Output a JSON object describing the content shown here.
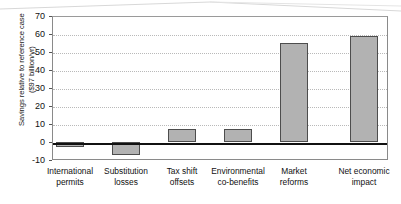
{
  "chart_data": {
    "type": "bar",
    "title": "",
    "subtitle": "",
    "xlabel": "",
    "ylabel": "Savings relative to reference case ($97 billion/yr)",
    "ylabel_lines": [
      "Savings relative to reference case",
      "($97 billion/yr)"
    ],
    "categories": [
      "International permits",
      "Substitution losses",
      "Tax shift offsets",
      "Environmental co-benefits",
      "Market reforms",
      "Net economic impact"
    ],
    "category_lines": [
      [
        "International",
        "permits"
      ],
      [
        "Substitution",
        "losses"
      ],
      [
        "Tax shift",
        "offsets"
      ],
      [
        "Environmental",
        "co-benefits"
      ],
      [
        "Market",
        "reforms"
      ],
      [
        "Net economic",
        "impact"
      ]
    ],
    "values": [
      -3,
      -7,
      7,
      7.5,
      55,
      59
    ],
    "ylim": [
      -10,
      70
    ],
    "yticks": [
      70,
      60,
      50,
      40,
      30,
      20,
      10,
      0,
      -10
    ],
    "ytick_labels": [
      "70",
      "60",
      "50",
      "40",
      "30",
      "20",
      "10",
      "0",
      "-10"
    ],
    "grid": true,
    "grid_style": "dotted",
    "legend": "none",
    "bar_color": "#b2b2b2",
    "bar_edge_color": "#4d4d4d",
    "zero_line_color": "#111111",
    "grid_color": "#b9b9b9",
    "axis_color": "#8a8a8a"
  }
}
